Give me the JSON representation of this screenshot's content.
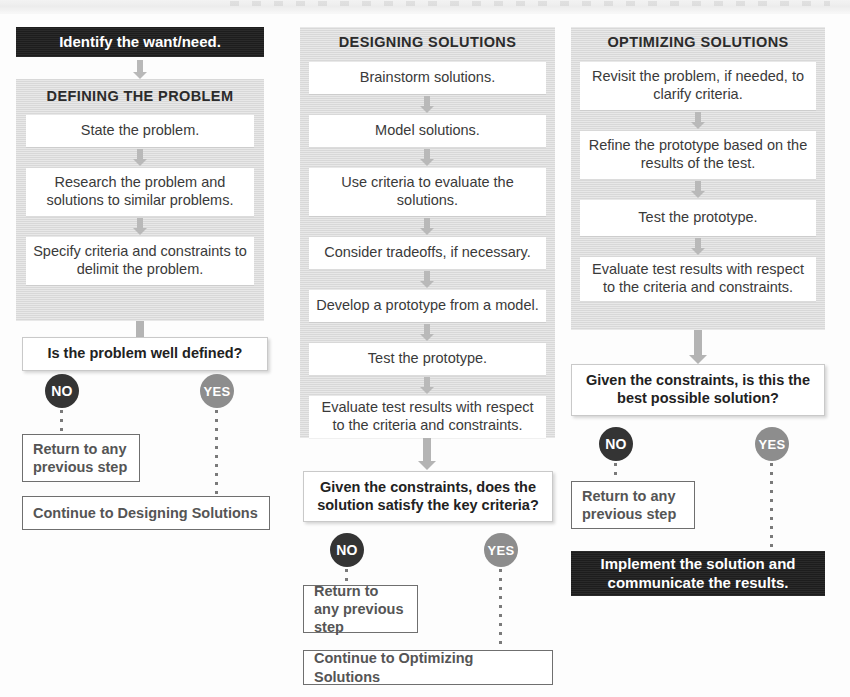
{
  "diagram": {
    "colors": {
      "panel_gray": "#dcdcdc",
      "banner_black": "#1d1d1d",
      "arrow_gray": "#b9b9b9",
      "no_badge": "#343434",
      "yes_badge": "#8d8d8d",
      "outline_border": "#6f6f6f",
      "body_text": "#3a3a3a"
    }
  },
  "columns": [
    {
      "id": "defining-the-problem",
      "intro_banner": "Identify the want/need.",
      "panel_title": "DEFINING THE PROBLEM",
      "steps": [
        "State the problem.",
        "Research the problem and solutions to similar problems.",
        "Specify criteria and constraints to delimit the problem."
      ],
      "decision": "Is the problem well defined?",
      "no_label": "NO",
      "yes_label": "YES",
      "no_outcome": "Return to any previous step",
      "yes_outcome": "Continue to Designing Solutions"
    },
    {
      "id": "designing-solutions",
      "intro_banner": null,
      "panel_title": "DESIGNING SOLUTIONS",
      "steps": [
        "Brainstorm solutions.",
        "Model solutions.",
        "Use criteria to evaluate the solutions.",
        "Consider tradeoffs, if necessary.",
        "Develop a prototype from a model.",
        "Test the prototype.",
        "Evaluate test results with respect to the criteria and constraints."
      ],
      "decision": "Given the constraints, does the solution satisfy the key criteria?",
      "no_label": "NO",
      "yes_label": "YES",
      "no_outcome": "Return to any previous step",
      "yes_outcome": "Continue to Optimizing Solutions"
    },
    {
      "id": "optimizing-solutions",
      "intro_banner": null,
      "panel_title": "OPTIMIZING SOLUTIONS",
      "steps": [
        "Revisit the problem, if needed, to clarify criteria.",
        "Refine the prototype based on the results of the test.",
        "Test the prototype.",
        "Evaluate test results with respect to the criteria and constraints."
      ],
      "decision": "Given the constraints, is this the best possible solution?",
      "no_label": "NO",
      "yes_label": "YES",
      "no_outcome": "Return to any previous step",
      "yes_outcome": "Implement the solution and communicate the results."
    }
  ]
}
